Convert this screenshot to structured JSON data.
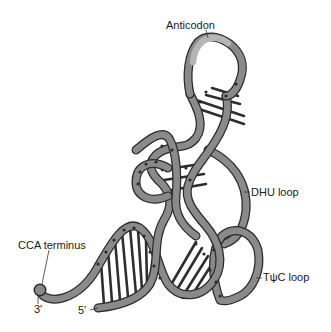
{
  "figure": {
    "labels": {
      "anticodon": "Anticodon",
      "dhu_loop": "DHU loop",
      "tpsic_loop": "TψC loop",
      "cca_terminus": "CCA terminus",
      "three_prime": "3′",
      "five_prime": "5′"
    },
    "colors": {
      "background": "#ffffff",
      "strand_fill": "#8a8a8a",
      "strand_outline": "#2b2b2b",
      "anticodon_highlight": "#b5b5b5",
      "base_pair_rungs": "#2e2e2e",
      "text": "#1a1a1a"
    }
  }
}
